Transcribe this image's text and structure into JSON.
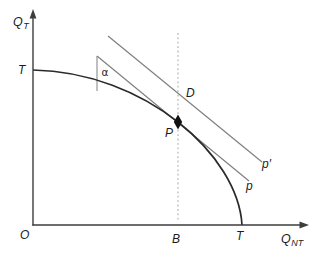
{
  "diagram": {
    "labels": {
      "y_axis_base": "Q",
      "y_axis_sub": "T",
      "x_axis_base": "Q",
      "x_axis_sub": "NT",
      "origin": "O",
      "t_vertical": "T",
      "t_horizontal": "T",
      "alpha": "α",
      "point_p": "P",
      "point_d": "D",
      "point_b": "B",
      "price_line": "p",
      "price_line_prime": "p′"
    },
    "colors": {
      "axis": "#3d3d3d",
      "curve": "#2a2a2a",
      "price_line": "#808080",
      "angle_leg": "#8a8a8a",
      "guide_dotted": "#b4b4b4",
      "marker": "#111111",
      "text": "#1c1c1c",
      "background": "#ffffff"
    }
  }
}
